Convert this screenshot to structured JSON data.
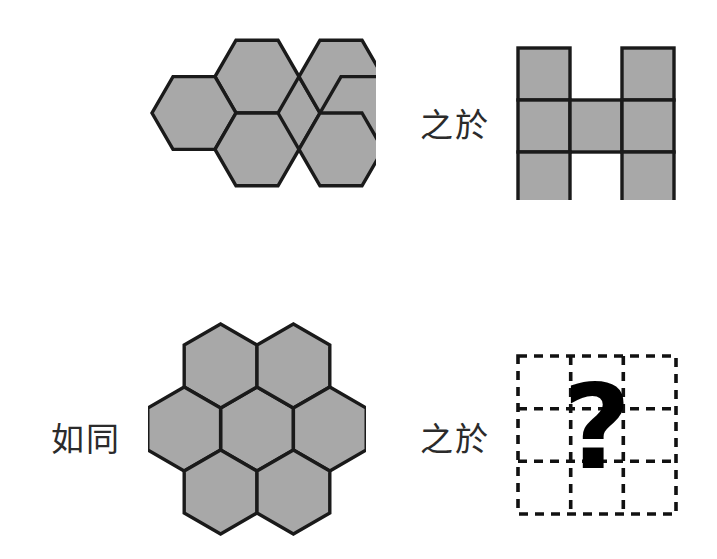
{
  "figure": {
    "kind": "visual-analogy-puzzle",
    "caption_language": "zh-Hant",
    "colors": {
      "shape_fill": "#a8a8a8",
      "shape_stroke": "#1a1a1a",
      "dashed_stroke": "#111111",
      "question_mark_color": "#000000",
      "background": "#ffffff",
      "text_color": "#2b2b2b"
    }
  },
  "relations": {
    "is_to": "之於",
    "as": "如同"
  },
  "panels": {
    "term_a": {
      "name": "hexagon-flower-flat-top",
      "shape": "hexagon",
      "orientation": "flat-top",
      "count": 7,
      "arrangement": "centered-flower",
      "fill": "#a8a8a8",
      "stroke": "#1a1a1a"
    },
    "term_b": {
      "name": "square-h-shape",
      "shape": "square",
      "count": 7,
      "arrangement": "3x3-grid-missing-top-middle-and-bottom-middle",
      "grid_rows": 3,
      "grid_cols": 3,
      "filled_cells": [
        [
          true,
          false,
          true
        ],
        [
          true,
          true,
          true
        ],
        [
          true,
          false,
          true
        ]
      ],
      "fill": "#a8a8a8",
      "stroke": "#1a1a1a"
    },
    "term_c": {
      "name": "hexagon-flower-pointy-top",
      "shape": "hexagon",
      "orientation": "pointy-top",
      "count": 7,
      "arrangement": "centered-flower",
      "fill": "#a8a8a8",
      "stroke": "#1a1a1a"
    },
    "term_d": {
      "name": "answer-placeholder-dashed-grid",
      "shape": "dashed-grid",
      "grid_rows": 3,
      "grid_cols": 3,
      "question_mark": "?",
      "stroke": "#111111",
      "stroke_style": "dashed"
    }
  }
}
